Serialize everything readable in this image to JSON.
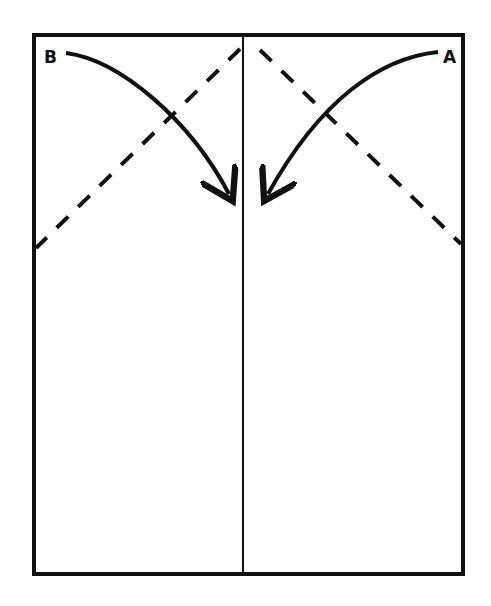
{
  "diagram": {
    "type": "fold-instructions",
    "labels": {
      "corner_left": "B",
      "corner_right": "A"
    },
    "colors": {
      "stroke": "#111111",
      "background": "#ffffff"
    },
    "elements": {
      "paper": "rectangle sheet",
      "center_crease": "vertical center line",
      "fold_lines": [
        "dashed diagonal left",
        "dashed diagonal right"
      ],
      "arrows": [
        "B folds toward center",
        "A folds toward center"
      ]
    }
  }
}
